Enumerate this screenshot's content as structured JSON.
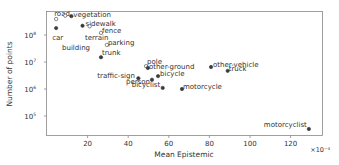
{
  "chart_data": {
    "type": "scatter",
    "title": "",
    "xlabel": "Mean Epistemic",
    "ylabel": "Number of points",
    "x_multiplier_label": "×10⁻⁴",
    "xlim": [
      0,
      135
    ],
    "ylim_log10": [
      4.25,
      8.9
    ],
    "yscale": "log",
    "grid": false,
    "x_ticks": [
      20,
      40,
      60,
      80,
      100,
      120
    ],
    "y_ticks": [
      {
        "label": "10",
        "exp": "8",
        "value": 100000000
      },
      {
        "label": "10",
        "exp": "7",
        "value": 10000000
      },
      {
        "label": "10",
        "exp": "6",
        "value": 1000000
      },
      {
        "label": "10",
        "exp": "5",
        "value": 100000
      }
    ],
    "points": [
      {
        "label": "road",
        "x": 4.5,
        "y": 390000000,
        "hollow": true,
        "lx": -2,
        "ly": -3
      },
      {
        "label": "car",
        "x": 4.5,
        "y": 180000000,
        "hollow": false,
        "lx": -4,
        "ly": 12
      },
      {
        "label": "vegetation",
        "x": 12,
        "y": 500000000,
        "hollow": false,
        "lx": 2,
        "ly": 1
      },
      {
        "label": "sidewalk",
        "x": 17.5,
        "y": 220000000,
        "hollow": false,
        "lx": 3,
        "ly": 0
      },
      {
        "label": "building",
        "x": 9,
        "y": 520000000,
        "hollow": true,
        "lx": 0,
        "ly": 0,
        "label_at": [
          62,
          50
        ]
      },
      {
        "label": "terrain",
        "x": 21,
        "y": 210000000,
        "hollow": true,
        "lx": 0,
        "ly": 0,
        "label_at": [
          85,
          40
        ]
      },
      {
        "label": "fence",
        "x": 26.6,
        "y": 120000000,
        "hollow": true,
        "lx": 1,
        "ly": 0
      },
      {
        "label": "parking",
        "x": 29.5,
        "y": 43000000,
        "hollow": true,
        "lx": 1,
        "ly": 0
      },
      {
        "label": "trunk",
        "x": 26.6,
        "y": 15000000,
        "hollow": false,
        "lx": 1,
        "ly": -2
      },
      {
        "label": "pole",
        "x": 48.8,
        "y": 7000000,
        "hollow": true,
        "lx": 1,
        "ly": -2
      },
      {
        "label": "other-ground",
        "x": 49.7,
        "y": 6000000,
        "hollow": false,
        "lx": 1,
        "ly": 1
      },
      {
        "label": "traffic-sign",
        "x": 45,
        "y": 2500000,
        "hollow": false,
        "lx": -41,
        "ly": 0
      },
      {
        "label": "person",
        "x": 51.7,
        "y": 2200000,
        "hollow": false,
        "lx": -26,
        "ly": 4
      },
      {
        "label": "bicycle",
        "x": 54.7,
        "y": 3000000,
        "hollow": false,
        "lx": 2,
        "ly": 0
      },
      {
        "label": "bicyclist",
        "x": 57,
        "y": 1100000,
        "hollow": false,
        "lx": -31,
        "ly": -1
      },
      {
        "label": "motorcycle",
        "x": 66.5,
        "y": 1000000,
        "hollow": false,
        "lx": 1,
        "ly": 0
      },
      {
        "label": "other-vehicle",
        "x": 80.8,
        "y": 6500000,
        "hollow": false,
        "lx": 2,
        "ly": 0
      },
      {
        "label": "truck",
        "x": 89,
        "y": 4700000,
        "hollow": false,
        "lx": 1,
        "ly": 0
      },
      {
        "label": "motorcyclist",
        "x": 129,
        "y": 33000,
        "hollow": false,
        "lx": -45,
        "ly": -2
      }
    ]
  },
  "colors": {
    "point": "#3a3a3a",
    "axis": "#888888",
    "text": "#333333"
  }
}
